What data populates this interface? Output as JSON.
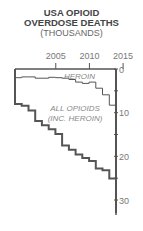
{
  "title": {
    "line1": "USA OPIOID",
    "line2": "OVERDOSE DEATHS",
    "line3": "(THOUSANDS)"
  },
  "labels": {
    "heroin": "HEROIN",
    "all_opioids_1": "ALL OPIOIDS",
    "all_opioids_2": "(INC. HEROIN)"
  },
  "x_ticks": [
    "2005",
    "2010",
    "2015"
  ],
  "y_ticks": [
    "0",
    "10",
    "20",
    "30"
  ],
  "chart_data": {
    "type": "line",
    "xlabel": "",
    "ylabel": "Deaths (thousands)",
    "x": [
      1999,
      2000,
      2001,
      2002,
      2003,
      2004,
      2005,
      2006,
      2007,
      2008,
      2009,
      2010,
      2011,
      2012,
      2013,
      2014,
      2015,
      2016
    ],
    "series": [
      {
        "name": "Heroin",
        "values": [
          2.0,
          1.8,
          1.8,
          2.1,
          2.1,
          1.9,
          2.0,
          2.1,
          2.4,
          3.0,
          3.3,
          3.0,
          4.4,
          5.9,
          8.3,
          10.6,
          13.0,
          15.5
        ]
      },
      {
        "name": "All opioids (inc. heroin)",
        "values": [
          8.0,
          8.4,
          9.5,
          11.9,
          12.9,
          13.8,
          14.9,
          17.5,
          18.5,
          19.6,
          20.4,
          21.1,
          22.8,
          23.2,
          25.1,
          28.6,
          33.1,
          42.2
        ]
      }
    ],
    "y_inverted": true,
    "ylim": [
      0,
      33
    ],
    "xlim": [
      1999,
      2016
    ],
    "grid": false,
    "legend": "inline labels"
  }
}
